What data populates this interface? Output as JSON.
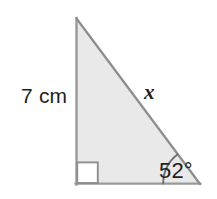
{
  "figure": {
    "type": "right-triangle-diagram",
    "background_color": "#ffffff",
    "fill_color": "#e8e8e8",
    "stroke_color": "#8a8a8a",
    "text_color": "#231f20",
    "geometry": {
      "vertices": {
        "top": {
          "x": 76,
          "y": 18
        },
        "bottom_left": {
          "x": 76,
          "y": 184
        },
        "bottom_right": {
          "x": 200,
          "y": 184
        }
      },
      "right_angle_marker": {
        "corner": "bottom-left",
        "size": 21,
        "fill": "#ffffff"
      },
      "angle_arc": {
        "at_vertex": "bottom_right",
        "radius": 37
      }
    },
    "labels": {
      "vertical_side": "7 cm",
      "hypotenuse": "x",
      "acute_angle": "52°"
    }
  }
}
